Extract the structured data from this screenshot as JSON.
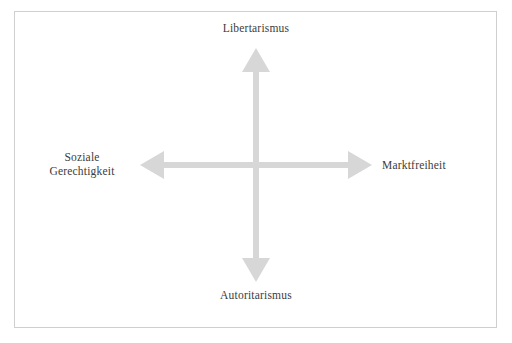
{
  "diagram": {
    "type": "political-compass-axes",
    "title_visible": false,
    "frame": {
      "border_color": "#cfcfcf",
      "background_color": "#ffffff"
    },
    "arrow_color": "#d7d7d7",
    "label_color": "#3c3c3c",
    "center": {
      "x": 256,
      "y": 165
    },
    "axes": {
      "vertical": {
        "top_label": "Libertarismus",
        "bottom_label": "Autoritarismus",
        "top_y": 48,
        "bottom_y": 282
      },
      "horizontal": {
        "left_label": "Soziale\nGerechtigkeit",
        "left_label_line1": "Soziale",
        "left_label_line2": "Gerechtigkeit",
        "right_label": "Marktfreiheit",
        "left_x": 140,
        "right_x": 372
      }
    },
    "icons": {
      "arrow_up": "arrow-up-icon",
      "arrow_down": "arrow-down-icon",
      "arrow_left": "arrow-left-icon",
      "arrow_right": "arrow-right-icon"
    }
  }
}
